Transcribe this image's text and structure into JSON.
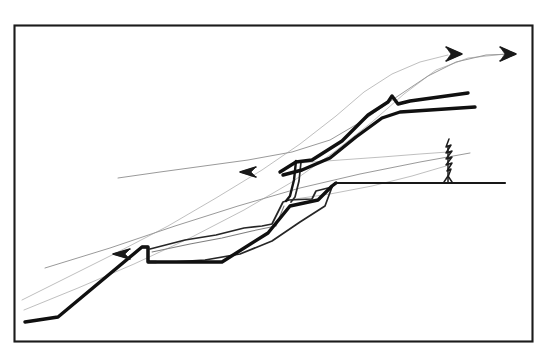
{
  "figure": {
    "kind": "hand-drawn-sketch",
    "medium": "pen-and-ink field sketch",
    "background_color": "#ffffff",
    "ink_color": "#101010",
    "ghost_ink_color": "#9a9a9a",
    "canvas": {
      "width": 549,
      "height": 364
    },
    "frame": {
      "name": "figure-border",
      "x": 14,
      "y": 25,
      "width": 519,
      "height": 317,
      "stroke_color": "#1b1b1b",
      "stroke_width": 2.1
    }
  },
  "elements": {
    "ground_line": {
      "name": "ground-surface-line",
      "description": "flat horizontal ground surface on the right, downslope of the scarp",
      "points": "335,183 360,183 400,183 440,183 470,183 505,183"
    },
    "slope_profile_main": {
      "name": "main-slope-profile",
      "description": "heavy continuous ink profile: valley floor at lower left rising to the upper-right crest",
      "points": "25,322 58,317 142,247 148,247 148,262 155,262 222,262 268,233 290,206 318,200 332,186 336,183"
    },
    "upper_scarp_heavy": {
      "name": "upper-scarp-heavy-line",
      "description": "thick upper scarp face rising to the right with a Z-shaped notch at the crest",
      "points": "280,172 296,162 312,160 342,141 368,115 388,102 392,96 398,104 410,101 468,93"
    },
    "lower_scarp_heavy": {
      "name": "lower-scarp-heavy-line",
      "description": "second thick line parallel and below the upper scarp, offset downslope",
      "points": "283,175 302,170 330,158 356,137 382,118 400,112 430,110 475,107"
    },
    "fault_plane_vertical": {
      "name": "vertical-fault-segment",
      "description": "near-vertical double-drawn fault plane in the centre of the section",
      "points_outer": "296,161 294,180 290,196 286,201",
      "points_inner": "301,162 299,181 295,197 291,202"
    },
    "graben_block": {
      "name": "graben-block-polygon",
      "description": "down-dropped central wedge block outlined in medium ink",
      "points": "150,249 185,240 216,235 244,228 262,226 272,224 283,202 289,200 312,199 316,191 332,187 325,206 300,222 272,241 240,254 205,260 172,262 155,262 148,262 148,248"
    },
    "graben_inner_line": {
      "name": "graben-inner-edge",
      "description": "inner sliver edge of the wedge block drawn as a thin second line",
      "points": "152,252 190,244 222,238 252,231 276,226 284,206"
    },
    "bench_step": {
      "name": "bench-step-notch",
      "description": "small rectangular step notch on the lower slope break",
      "points": "142,247 148,247 148,262 156,262"
    },
    "slip_surface_ghost": {
      "name": "slip-surface-ghost-curve",
      "description": "faint pencil guide line marking the inferred basal slip surface, sweeping from lower-left to upper-right",
      "points": "22,300 70,276 118,252 168,226 216,198 262,170 300,144 336,116 364,92 392,74 420,62 448,55"
    },
    "slip_surface_ghost_b": {
      "name": "slip-surface-ghost-curve-secondary",
      "description": "second faint guide line, slightly lower and flatter than the first",
      "points": "24,310 78,288 134,264 190,238 244,210 292,182 334,152 372,122 404,94 436,70 468,58 506,54"
    },
    "ghost_upper_arc": {
      "name": "upper-ghost-arc",
      "description": "faint arc from mid-left rising gently then flattening toward the upper-right arrows",
      "points": "118,178 160,172 204,166 248,160 292,152 330,140 364,120 398,96 428,76 456,62 486,55 512,54"
    },
    "ghost_lower_ray": {
      "name": "lower-ghost-ray",
      "description": "faint straight guide line from lower-left up to the right margin",
      "points": "45,268 110,248 175,226 238,206 300,188 360,174 420,162 470,153"
    },
    "ghost_tree_ray_a": {
      "name": "ghost-ray-to-tree-upper",
      "description": "faint line running from the fault crest area to the tree on the right",
      "points": "300,163 340,160 382,157 420,154 448,152"
    },
    "ghost_tree_ray_b": {
      "name": "ghost-ray-to-tree-lower",
      "description": "second faint line converging on the tree base",
      "points": "288,200 330,194 372,186 412,176 446,166"
    },
    "arrows": [
      {
        "name": "arrow-right-crest",
        "direction": "right",
        "tip_x": 462,
        "tip_y": 54,
        "description": "upper arrowhead on the ghost transport path pointing downslope to the right"
      },
      {
        "name": "arrow-right-margin",
        "direction": "right",
        "tip_x": 516,
        "tip_y": 54,
        "description": "second right-pointing arrowhead at the right-hand margin"
      },
      {
        "name": "arrow-left-middle",
        "direction": "left",
        "tip_x": 240,
        "tip_y": 172,
        "description": "left-pointing arrowhead on the mid-slope ghost line"
      },
      {
        "name": "arrow-left-lower",
        "direction": "left",
        "tip_x": 113,
        "tip_y": 254,
        "description": "left-pointing arrowhead on the lower ghost line"
      }
    ],
    "tree": {
      "name": "conifer-tree-symbol",
      "description": "small hand-drawn conifer standing on the flat ground surface to the right for scale",
      "base_x": 448,
      "base_y": 183,
      "top_x": 449,
      "top_y": 139,
      "height_px": 44
    }
  }
}
